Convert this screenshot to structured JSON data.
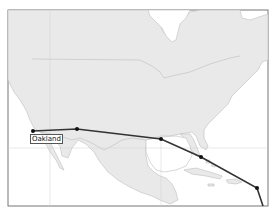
{
  "map": {
    "frame": {
      "x": 8,
      "y": 10,
      "width": 260,
      "height": 196
    },
    "colors": {
      "land": "#e9e9e9",
      "water": "#ffffff",
      "border": "#bdbdbd",
      "frame": "#777777",
      "route": "#333333",
      "stop": "#111111",
      "graticule": "#d0d0d0"
    },
    "route": {
      "points": [
        {
          "x": 33,
          "y": 131,
          "label": "Oakland"
        },
        {
          "x": 77,
          "y": 129
        },
        {
          "x": 161,
          "y": 139
        },
        {
          "x": 201,
          "y": 157
        },
        {
          "x": 257,
          "y": 188
        },
        {
          "x": 263,
          "y": 206
        }
      ]
    },
    "labels": [
      {
        "name": "city-label-oakland",
        "text": "Oakland",
        "x": 30,
        "y": 134
      }
    ]
  }
}
